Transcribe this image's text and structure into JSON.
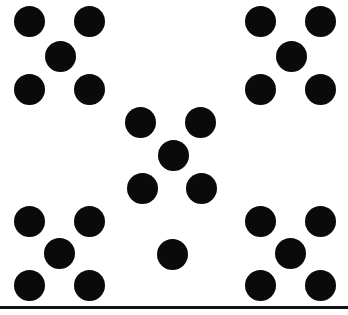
{
  "figure": {
    "width": 348,
    "height": 315,
    "background_color": "#ffffff",
    "dot_color": "#0a0a0a",
    "dot_diameter": 31,
    "total_dots": 21,
    "caption": ""
  },
  "baseline_rule": {
    "name": "bottom-rule",
    "x": 0,
    "y": 306,
    "width": 348,
    "height": 3,
    "color": "#141414"
  },
  "groups": [
    {
      "id": "top-left-quincunx",
      "label": "Top-left quincunx",
      "count": 5,
      "arrangement": "quincunx",
      "center": [
        59,
        56
      ],
      "dots": [
        {
          "name": "dot-tl-1",
          "cx": 29,
          "cy": 21,
          "r": 15.5,
          "role": "corner-top-left"
        },
        {
          "name": "dot-tl-2",
          "cx": 89,
          "cy": 21,
          "r": 15.5,
          "role": "corner-top-right"
        },
        {
          "name": "dot-tl-3",
          "cx": 60,
          "cy": 56,
          "r": 15.5,
          "role": "center"
        },
        {
          "name": "dot-tl-4",
          "cx": 29,
          "cy": 89,
          "r": 15.5,
          "role": "corner-bottom-left"
        },
        {
          "name": "dot-tl-5",
          "cx": 89,
          "cy": 89,
          "r": 15.5,
          "role": "corner-bottom-right"
        }
      ]
    },
    {
      "id": "top-right-quincunx",
      "label": "Top-right quincunx",
      "count": 5,
      "arrangement": "quincunx",
      "center": [
        290,
        56
      ],
      "dots": [
        {
          "name": "dot-tr-1",
          "cx": 260,
          "cy": 21,
          "r": 15.5,
          "role": "corner-top-left"
        },
        {
          "name": "dot-tr-2",
          "cx": 320,
          "cy": 21,
          "r": 15.5,
          "role": "corner-top-right"
        },
        {
          "name": "dot-tr-3",
          "cx": 291,
          "cy": 56,
          "r": 15.5,
          "role": "center"
        },
        {
          "name": "dot-tr-4",
          "cx": 260,
          "cy": 89,
          "r": 15.5,
          "role": "corner-bottom-left"
        },
        {
          "name": "dot-tr-5",
          "cx": 320,
          "cy": 89,
          "r": 15.5,
          "role": "corner-bottom-right"
        }
      ]
    },
    {
      "id": "center-quincunx",
      "label": "Center quincunx",
      "count": 5,
      "arrangement": "quincunx",
      "center": [
        173,
        155
      ],
      "dots": [
        {
          "name": "dot-c-1",
          "cx": 140,
          "cy": 122,
          "r": 15.5,
          "role": "corner-top-left"
        },
        {
          "name": "dot-c-2",
          "cx": 200,
          "cy": 122,
          "r": 15.5,
          "role": "corner-top-right"
        },
        {
          "name": "dot-c-3",
          "cx": 173,
          "cy": 155,
          "r": 15.5,
          "role": "center"
        },
        {
          "name": "dot-c-4",
          "cx": 142,
          "cy": 188,
          "r": 15.5,
          "role": "corner-bottom-left"
        },
        {
          "name": "dot-c-5",
          "cx": 201,
          "cy": 188,
          "r": 15.5,
          "role": "corner-bottom-right"
        }
      ]
    },
    {
      "id": "bottom-left-quincunx",
      "label": "Bottom-left quincunx",
      "count": 5,
      "arrangement": "quincunx",
      "center": [
        59,
        253
      ],
      "dots": [
        {
          "name": "dot-bl-1",
          "cx": 29,
          "cy": 221,
          "r": 15.5,
          "role": "corner-top-left"
        },
        {
          "name": "dot-bl-2",
          "cx": 89,
          "cy": 221,
          "r": 15.5,
          "role": "corner-top-right"
        },
        {
          "name": "dot-bl-3",
          "cx": 59,
          "cy": 253,
          "r": 15.5,
          "role": "center"
        },
        {
          "name": "dot-bl-4",
          "cx": 29,
          "cy": 285,
          "r": 15.5,
          "role": "corner-bottom-left"
        },
        {
          "name": "dot-bl-5",
          "cx": 89,
          "cy": 285,
          "r": 15.5,
          "role": "corner-bottom-right"
        }
      ]
    },
    {
      "id": "bottom-right-quincunx",
      "label": "Bottom-right quincunx",
      "count": 5,
      "arrangement": "quincunx",
      "center": [
        290,
        253
      ],
      "dots": [
        {
          "name": "dot-br-1",
          "cx": 260,
          "cy": 221,
          "r": 15.5,
          "role": "corner-top-left"
        },
        {
          "name": "dot-br-2",
          "cx": 320,
          "cy": 221,
          "r": 15.5,
          "role": "corner-top-right"
        },
        {
          "name": "dot-br-3",
          "cx": 290,
          "cy": 253,
          "r": 15.5,
          "role": "center"
        },
        {
          "name": "dot-br-4",
          "cx": 260,
          "cy": 285,
          "r": 15.5,
          "role": "corner-bottom-left"
        },
        {
          "name": "dot-br-5",
          "cx": 320,
          "cy": 285,
          "r": 15.5,
          "role": "corner-bottom-right"
        }
      ]
    },
    {
      "id": "bottom-center-single",
      "label": "Bottom-center single dot",
      "count": 1,
      "arrangement": "single",
      "center": [
        172,
        254
      ],
      "dots": [
        {
          "name": "dot-single-1",
          "cx": 172,
          "cy": 254,
          "r": 15.5,
          "role": "single"
        }
      ]
    }
  ]
}
